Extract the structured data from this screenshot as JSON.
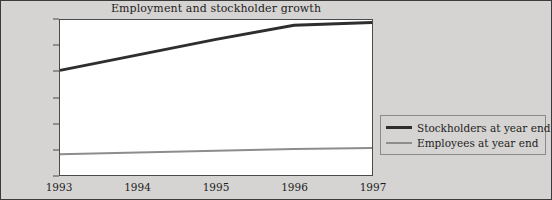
{
  "figure": {
    "background_color": "#d5d4d2",
    "plot_background_color": "#ffffff",
    "border_color": "#3b3b3b"
  },
  "legend": {
    "position": "right",
    "entries": [
      {
        "label": "Stockholders at year end",
        "color": "#2e2e2e",
        "icon": "thick-line-swatch"
      },
      {
        "label": "Employees at year end",
        "color": "#8d8d8b",
        "icon": "thin-line-swatch"
      }
    ]
  },
  "chart_data": {
    "type": "line",
    "title": "Employment and stockholder growth",
    "xlabel": "",
    "ylabel": "",
    "categories": [
      "1993",
      "1994",
      "1995",
      "1996",
      "1997"
    ],
    "x": [
      1993,
      1994,
      1995,
      1996,
      1997
    ],
    "xlim": [
      1993,
      1997
    ],
    "ylim": [
      0,
      600000
    ],
    "ytick_labels": [
      "0",
      "100,000",
      "200,000",
      "300,000",
      "400,000",
      "500,000",
      "600,000"
    ],
    "yticks": [
      0,
      100000,
      200000,
      300000,
      400000,
      500000,
      600000
    ],
    "grid": false,
    "legend_position": "right",
    "series": [
      {
        "name": "Stockholders at year end",
        "color": "#2e2e2e",
        "width": 3,
        "values": [
          405000,
          465000,
          525000,
          580000,
          590000
        ]
      },
      {
        "name": "Employees at year end",
        "color": "#8d8d8b",
        "width": 2,
        "values": [
          80000,
          87000,
          94000,
          101000,
          105000
        ]
      }
    ]
  }
}
